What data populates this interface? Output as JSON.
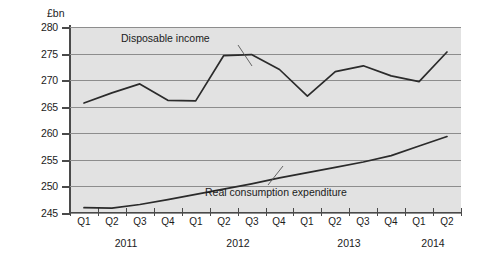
{
  "chart_data": {
    "type": "line",
    "title": "",
    "subtitle": "",
    "xlabel": "",
    "ylabel": "£bn",
    "yaxis_unit_label": "£bn",
    "ylim": [
      245,
      280
    ],
    "ytick_labels": [
      "245",
      "250",
      "255",
      "260",
      "265",
      "270",
      "275",
      "280"
    ],
    "ytick_values": [
      245,
      250,
      255,
      260,
      265,
      270,
      275,
      280
    ],
    "grid": true,
    "grid_axis": "y",
    "legend": "none",
    "legend_position": "inline-annotations",
    "categories": [
      "Q1",
      "Q2",
      "Q3",
      "Q4",
      "Q1",
      "Q2",
      "Q3",
      "Q4",
      "Q1",
      "Q2",
      "Q3",
      "Q4",
      "Q1",
      "Q2"
    ],
    "x": [
      "2011 Q1",
      "2011 Q2",
      "2011 Q3",
      "2011 Q4",
      "2012 Q1",
      "2012 Q2",
      "2012 Q3",
      "2012 Q4",
      "2013 Q1",
      "2013 Q2",
      "2013 Q3",
      "2013 Q4",
      "2014 Q1",
      "2014 Q2"
    ],
    "year_groups": [
      {
        "label": "2011",
        "start_index": 0,
        "end_index": 3
      },
      {
        "label": "2012",
        "start_index": 4,
        "end_index": 7
      },
      {
        "label": "2013",
        "start_index": 8,
        "end_index": 11
      },
      {
        "label": "2014",
        "start_index": 12,
        "end_index": 13
      }
    ],
    "series": [
      {
        "name": "Disposable income",
        "color": "#2b2b2b",
        "values": [
          265.7,
          267.6,
          269.3,
          266.2,
          266.1,
          274.6,
          274.8,
          272.0,
          267.0,
          271.6,
          272.7,
          270.8,
          269.7,
          275.3
        ]
      },
      {
        "name": "Real consumption expenditure",
        "color": "#2b2b2b",
        "values": [
          246.0,
          245.9,
          246.6,
          247.5,
          248.5,
          249.5,
          250.5,
          251.6,
          252.6,
          253.6,
          254.6,
          255.8,
          257.6,
          259.4
        ]
      }
    ],
    "annotations": [
      {
        "text": "Disposable income",
        "series": "Disposable income"
      },
      {
        "text": "Real consumption expenditure",
        "series": "Real consumption expenditure"
      }
    ],
    "plot_background": "#e2e2e2",
    "gridline_color": "#8d8d8d",
    "axis_color": "#4a4a4a",
    "line_color": "#2b2b2b"
  }
}
